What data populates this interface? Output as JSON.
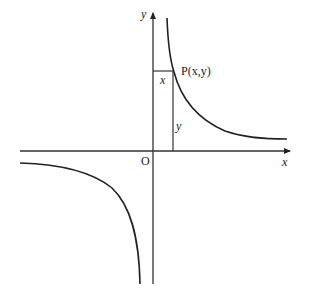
{
  "diagram": {
    "type": "hyperbola graph",
    "equation": "y = k/x",
    "axes": {
      "x_label": "x",
      "y_label": "y",
      "origin_label": "O"
    },
    "point": {
      "label": "P(x,y)"
    },
    "rectangle_labels": {
      "width": "x",
      "height": "y"
    },
    "colors": {
      "stroke": "#222222",
      "background": "#ffffff"
    }
  }
}
